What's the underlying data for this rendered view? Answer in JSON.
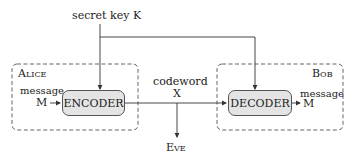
{
  "diagram": {
    "key_label": "secret key K",
    "alice_label": "Alice",
    "bob_label": "Bob",
    "encoder_label": "ENCODER",
    "decoder_label": "DECODER",
    "codeword_label": "codeword",
    "codeword_symbol": "X",
    "eve_label": "Eve",
    "alice_message_label": "message",
    "alice_message_symbol": "M",
    "bob_message_label": "message",
    "bob_message_symbol": "M"
  }
}
